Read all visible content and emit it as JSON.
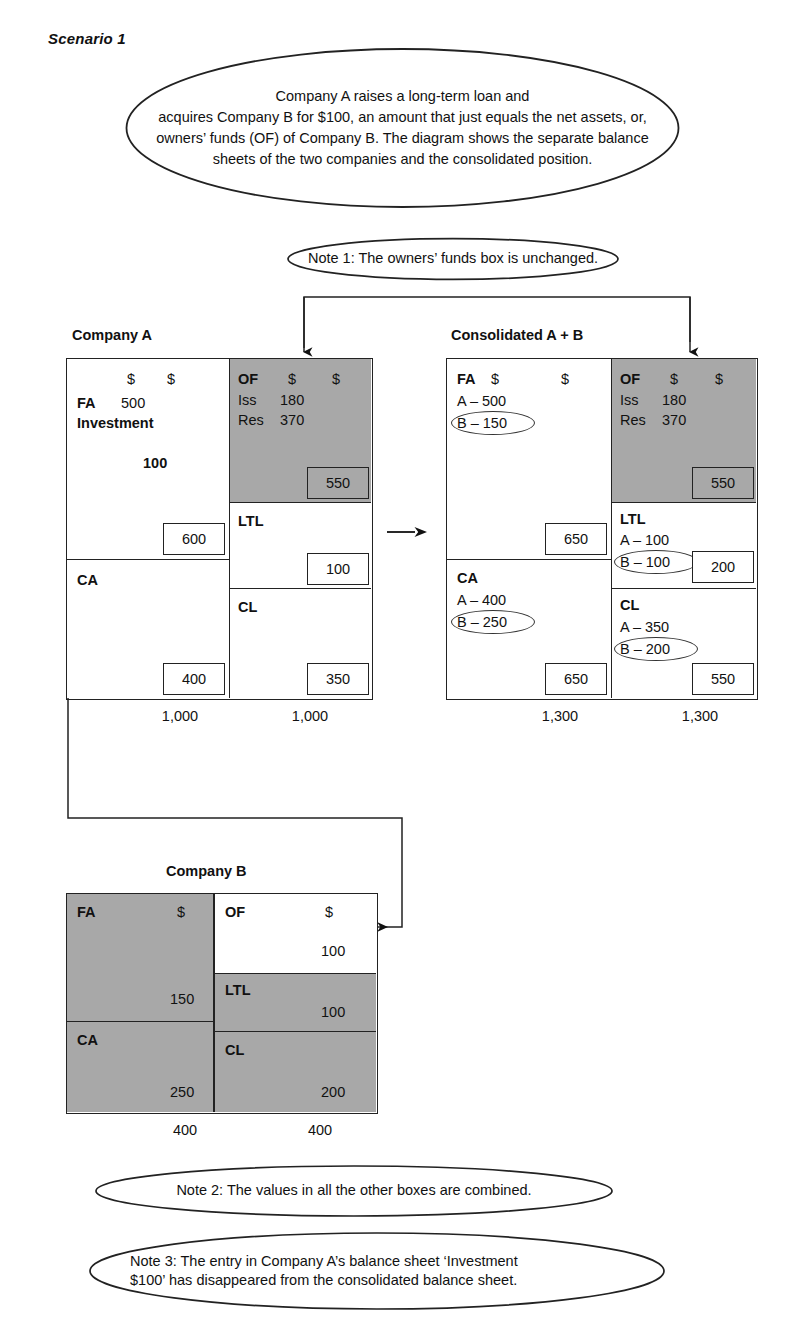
{
  "scenario": {
    "title": "Scenario 1"
  },
  "callouts": {
    "intro": "Company A raises a long-term loan and\nacquires Company B for $100, an amount that just equals the net assets, or,\nowners’ funds (OF) of Company B. The diagram shows the separate balance\nsheets of the two companies and the consolidated position.",
    "note1": "Note 1: The owners’ funds box is unchanged.",
    "note2": "Note 2: The values in all the other boxes are combined.",
    "note3": "Note 3: The entry in Company A’s balance sheet ‘Investment\n$100’ has disappeared from the consolidated balance sheet."
  },
  "symbols": {
    "dollar": "$",
    "arrow_right": "→"
  },
  "company_a": {
    "title": "Company A",
    "assets": {
      "fa_label": "FA",
      "fa_value": "500",
      "investment_label": "Investment",
      "investment_value": "100",
      "fa_total": "600",
      "ca_label": "CA",
      "ca_total": "400",
      "dollar_1": "$",
      "dollar_2": "$",
      "grand_total": "1,000"
    },
    "liabilities": {
      "of_label": "OF",
      "iss_label": "Iss",
      "iss_value": "180",
      "res_label": "Res",
      "res_value": "370",
      "of_total": "550",
      "ltl_label": "LTL",
      "ltl_total": "100",
      "cl_label": "CL",
      "cl_total": "350",
      "dollar_1": "$",
      "dollar_2": "$",
      "grand_total": "1,000"
    }
  },
  "consolidated": {
    "title": "Consolidated A + B",
    "assets": {
      "fa_label": "FA",
      "fa_a": "A – 500",
      "fa_b": "B – 150",
      "fa_total": "650",
      "ca_label": "CA",
      "ca_a": "A – 400",
      "ca_b": "B – 250",
      "ca_total": "650",
      "dollar_1": "$",
      "dollar_2": "$",
      "grand_total": "1,300"
    },
    "liabilities": {
      "of_label": "OF",
      "iss_label": "Iss",
      "iss_value": "180",
      "res_label": "Res",
      "res_value": "370",
      "of_total": "550",
      "ltl_label": "LTL",
      "ltl_a": "A – 100",
      "ltl_b": "B – 100",
      "ltl_total": "200",
      "cl_label": "CL",
      "cl_a": "A – 350",
      "cl_b": "B – 200",
      "cl_total": "550",
      "dollar_1": "$",
      "dollar_2": "$",
      "grand_total": "1,300"
    }
  },
  "company_b": {
    "title": "Company B",
    "assets": {
      "fa_label": "FA",
      "fa_total": "150",
      "ca_label": "CA",
      "ca_total": "250",
      "dollar_1": "$",
      "grand_total": "400"
    },
    "liabilities": {
      "of_label": "OF",
      "of_total": "100",
      "ltl_label": "LTL",
      "ltl_total": "100",
      "cl_label": "CL",
      "cl_total": "200",
      "dollar_1": "$",
      "grand_total": "400"
    }
  },
  "colors": {
    "shaded_fill": "#a8a8a8",
    "line": "#222222",
    "background": "#ffffff"
  }
}
